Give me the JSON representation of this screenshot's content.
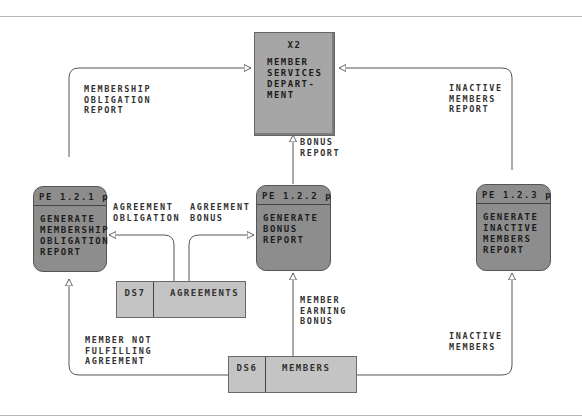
{
  "external_entity": {
    "id": "X2",
    "name": "MEMBER\nSERVICES\nDEPART-\nMENT"
  },
  "processes": [
    {
      "id": "PE 1.2.1 p",
      "name": "GENERATE\nMEMBERSHIP\nOBLIGATION\nREPORT"
    },
    {
      "id": "PE 1.2.2 p",
      "name": "GENERATE\nBONUS\nREPORT"
    },
    {
      "id": "PE 1.2.3 p",
      "name": "GENERATE\nINACTIVE\nMEMBERS\nREPORT"
    }
  ],
  "data_stores": [
    {
      "id": "DS7",
      "name": "AGREEMENTS"
    },
    {
      "id": "DS6",
      "name": "MEMBERS"
    }
  ],
  "flows": {
    "membership_obligation_report": "MEMBERSHIP\nOBLIGATION\nREPORT",
    "bonus_report": "BONUS\nREPORT",
    "inactive_members_report": "INACTIVE\nMEMBERS\nREPORT",
    "agreement_obligation": "AGREEMENT\nOBLIGATION",
    "agreement_bonus": "AGREEMENT\nBONUS",
    "member_earning_bonus": "MEMBER\nEARNING\nBONUS",
    "member_not_fulfilling": "MEMBER NOT\nFULFILLING\nAGREEMENT",
    "inactive_members": "INACTIVE\nMEMBERS"
  }
}
